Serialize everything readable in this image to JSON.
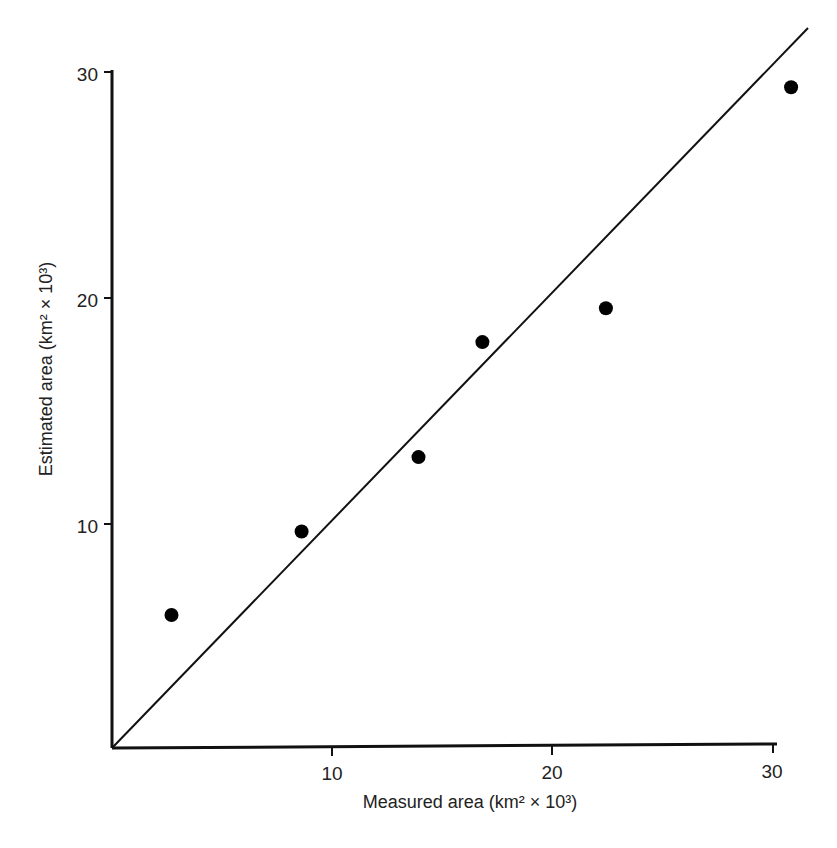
{
  "chart_data": {
    "type": "scatter",
    "title": "",
    "xlabel": "Measured area (km² × 10³)",
    "ylabel": "Estimated area (km² × 10³)",
    "xlim": [
      0,
      32
    ],
    "ylim": [
      0,
      32
    ],
    "x_ticks": [
      10,
      20,
      30
    ],
    "y_ticks": [
      10,
      20,
      30
    ],
    "grid": false,
    "legend": null,
    "series": [
      {
        "name": "Observations",
        "marker": "filled-circle",
        "color": "#000000",
        "points": [
          {
            "x": 2.7,
            "y": 5.9
          },
          {
            "x": 8.6,
            "y": 9.6
          },
          {
            "x": 13.9,
            "y": 12.9
          },
          {
            "x": 16.8,
            "y": 18.0
          },
          {
            "x": 22.4,
            "y": 19.5
          },
          {
            "x": 30.8,
            "y": 29.3
          }
        ]
      },
      {
        "name": "1:1 line",
        "type": "line",
        "color": "#000000",
        "points": [
          {
            "x": 0,
            "y": 0
          },
          {
            "x": 31.6,
            "y": 31.9
          }
        ]
      }
    ]
  },
  "labels": {
    "x_title": "Measured area (km² × 10³)",
    "y_title": "Estimated area (km² × 10³)",
    "x_tick_10": "10",
    "x_tick_20": "20",
    "x_tick_30": "30",
    "y_tick_10": "10",
    "y_tick_20": "20",
    "y_tick_30": "30"
  }
}
